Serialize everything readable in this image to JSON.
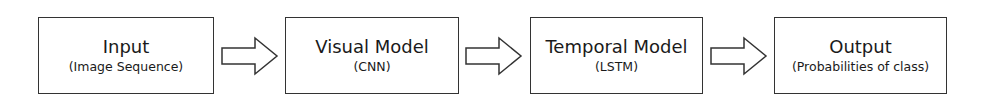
{
  "diagram": {
    "type": "flowchart",
    "direction": "left-to-right",
    "nodes": [
      {
        "title": "Input",
        "subtitle": "(Image Sequence)"
      },
      {
        "title": "Visual Model",
        "subtitle": "(CNN)"
      },
      {
        "title": "Temporal Model",
        "subtitle": "(LSTM)"
      },
      {
        "title": "Output",
        "subtitle": "(Probabilities of class)"
      }
    ],
    "edges": [
      {
        "from": "Input",
        "to": "Visual Model"
      },
      {
        "from": "Visual Model",
        "to": "Temporal Model"
      },
      {
        "from": "Temporal Model",
        "to": "Output"
      }
    ],
    "colors": {
      "stroke": "#333333",
      "background": "#ffffff"
    }
  }
}
